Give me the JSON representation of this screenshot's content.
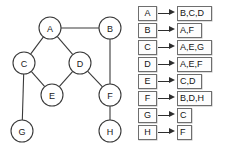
{
  "graph": {
    "nodes": [
      {
        "id": "A",
        "label": "A",
        "cx": 50,
        "cy": 28,
        "r": 11
      },
      {
        "id": "B",
        "label": "B",
        "cx": 110,
        "cy": 28,
        "r": 11
      },
      {
        "id": "C",
        "label": "C",
        "cx": 24,
        "cy": 63,
        "r": 11
      },
      {
        "id": "D",
        "label": "D",
        "cx": 80,
        "cy": 63,
        "r": 11
      },
      {
        "id": "E",
        "label": "E",
        "cx": 52,
        "cy": 95,
        "r": 11
      },
      {
        "id": "F",
        "label": "F",
        "cx": 110,
        "cy": 95,
        "r": 11
      },
      {
        "id": "G",
        "label": "G",
        "cx": 22,
        "cy": 131,
        "r": 11
      },
      {
        "id": "H",
        "label": "H",
        "cx": 110,
        "cy": 131,
        "r": 11
      }
    ],
    "edges": [
      {
        "from": "A",
        "to": "B"
      },
      {
        "from": "A",
        "to": "C"
      },
      {
        "from": "A",
        "to": "D"
      },
      {
        "from": "B",
        "to": "F"
      },
      {
        "from": "C",
        "to": "E"
      },
      {
        "from": "C",
        "to": "G"
      },
      {
        "from": "D",
        "to": "E"
      },
      {
        "from": "D",
        "to": "F"
      },
      {
        "from": "F",
        "to": "H"
      }
    ],
    "node_stroke_color": "#3a3a3a",
    "node_fill_color": "#ffffff",
    "edge_color": "#3a3a3a"
  },
  "adjacency_list": {
    "rows": [
      {
        "key": "A",
        "value": "B,C,D",
        "value_width": 35
      },
      {
        "key": "B",
        "value": "A,F",
        "value_width": 25
      },
      {
        "key": "C",
        "value": "A,E,G",
        "value_width": 35
      },
      {
        "key": "D",
        "value": "A,E,F",
        "value_width": 35
      },
      {
        "key": "E",
        "value": "C,D",
        "value_width": 25
      },
      {
        "key": "F",
        "value": "B,D,H",
        "value_width": 35
      },
      {
        "key": "G",
        "value": "C",
        "value_width": 15
      },
      {
        "key": "H",
        "value": "F",
        "value_width": 15
      }
    ],
    "arrow_color": "#2e2e2e",
    "box_border_color": "#6e6e6e"
  }
}
